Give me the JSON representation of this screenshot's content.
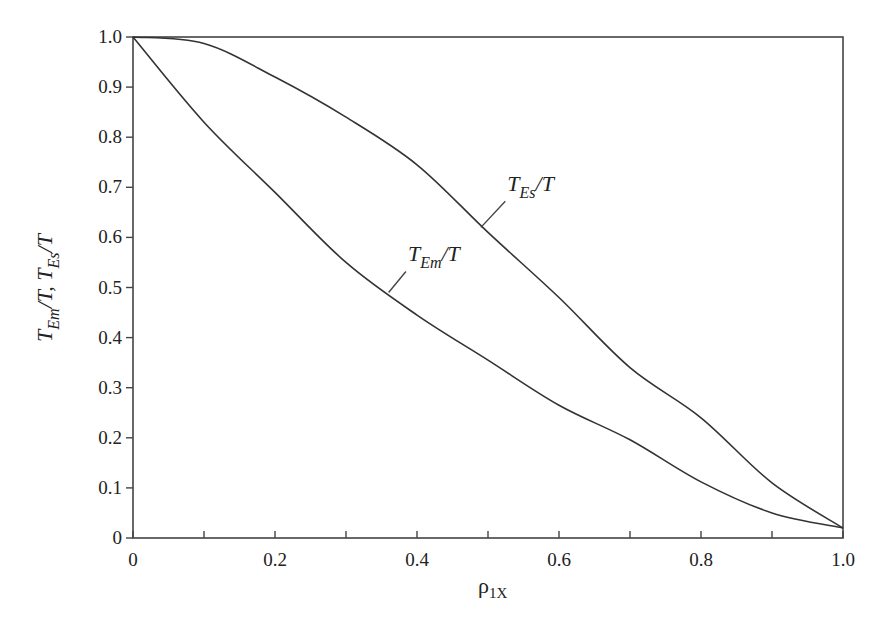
{
  "chart_data": {
    "type": "line",
    "title": "",
    "xlabel": "ρ1X",
    "xlabel_parts": {
      "main": "ρ",
      "sub": "1X"
    },
    "ylabel": "TEm/T, TEs/T",
    "xlim": [
      0,
      1.0
    ],
    "ylim": [
      0,
      1.0
    ],
    "x_ticks": [
      0,
      0.1,
      0.2,
      0.3,
      0.4,
      0.5,
      0.6,
      0.7,
      0.8,
      0.9,
      1.0
    ],
    "x_tick_labels": [
      "0",
      "",
      "0.2",
      "",
      "0.4",
      "",
      "0.6",
      "",
      "0.8",
      "",
      "1.0"
    ],
    "y_ticks": [
      0,
      0.1,
      0.2,
      0.3,
      0.4,
      0.5,
      0.6,
      0.7,
      0.8,
      0.9,
      1.0
    ],
    "y_tick_labels": [
      "0",
      "0.1",
      "0.2",
      "0.3",
      "0.4",
      "0.5",
      "0.6",
      "0.7",
      "0.8",
      "0.9",
      "1.0"
    ],
    "grid": false,
    "legend": "none (inline curve labels)",
    "x": [
      0,
      0.1,
      0.2,
      0.3,
      0.4,
      0.5,
      0.6,
      0.7,
      0.8,
      0.9,
      1.0
    ],
    "series": [
      {
        "name": "TEs/T",
        "label_main": "T",
        "label_sub": "Es",
        "label_tail": "/T",
        "label_anchor": {
          "x": 0.49,
          "y": 0.62
        },
        "label_pos": {
          "x": 0.53,
          "y": 0.68
        },
        "values": [
          1.0,
          0.987,
          0.92,
          0.84,
          0.745,
          0.61,
          0.48,
          0.34,
          0.24,
          0.11,
          0.02
        ]
      },
      {
        "name": "TEm/T",
        "label_main": "T",
        "label_sub": "Em",
        "label_tail": "/T",
        "label_anchor": {
          "x": 0.36,
          "y": 0.49
        },
        "label_pos": {
          "x": 0.39,
          "y": 0.54
        },
        "values": [
          1.0,
          0.83,
          0.69,
          0.55,
          0.445,
          0.355,
          0.265,
          0.196,
          0.112,
          0.05,
          0.02
        ]
      }
    ]
  }
}
